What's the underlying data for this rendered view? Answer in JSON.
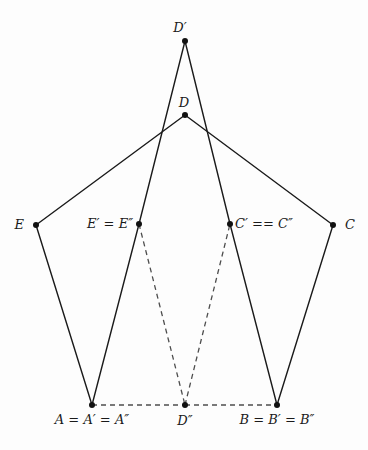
{
  "figure": {
    "width": 368,
    "height": 450,
    "background_color": "#fdfdfd",
    "stroke_color": "#1a1a1a",
    "dash_color": "#555555"
  },
  "points": {
    "D_prime": {
      "label": "D′",
      "x": 185,
      "y": 41,
      "label_x": 180,
      "label_y": 27,
      "align": "center"
    },
    "D": {
      "label": "D",
      "x": 185,
      "y": 115,
      "label_x": 184,
      "label_y": 102,
      "align": "center"
    },
    "E": {
      "label": "E",
      "x": 36,
      "y": 225,
      "label_x": 24,
      "label_y": 224,
      "align": "right"
    },
    "E_prime": {
      "label": "E′ = E″",
      "x": 139,
      "y": 224,
      "label_x": 133,
      "label_y": 223,
      "align": "right"
    },
    "C_prime": {
      "label": "C′ == C″",
      "x": 230,
      "y": 224,
      "label_x": 235,
      "label_y": 223,
      "align": "left"
    },
    "C": {
      "label": "C",
      "x": 333,
      "y": 225,
      "label_x": 345,
      "label_y": 224,
      "align": "left"
    },
    "A": {
      "label": "A = A′ = A″",
      "x": 92,
      "y": 405,
      "label_x": 92,
      "label_y": 419,
      "align": "center"
    },
    "D_dprime": {
      "label": "D″",
      "x": 185,
      "y": 405,
      "label_x": 185,
      "label_y": 420,
      "align": "center"
    },
    "B": {
      "label": "B = B′ = B″",
      "x": 277,
      "y": 405,
      "label_x": 277,
      "label_y": 419,
      "align": "center"
    }
  },
  "edges_solid": [
    {
      "name": "edge-E-D",
      "x1": 36,
      "y1": 225,
      "x2": 185,
      "y2": 115
    },
    {
      "name": "edge-D-C",
      "x1": 185,
      "y1": 115,
      "x2": 333,
      "y2": 225
    },
    {
      "name": "edge-E-A",
      "x1": 36,
      "y1": 225,
      "x2": 92,
      "y2": 405
    },
    {
      "name": "edge-C-B",
      "x1": 333,
      "y1": 225,
      "x2": 277,
      "y2": 405
    },
    {
      "name": "edge-Dprime-Eprime",
      "x1": 185,
      "y1": 41,
      "x2": 139,
      "y2": 224
    },
    {
      "name": "edge-Dprime-Cprime",
      "x1": 185,
      "y1": 41,
      "x2": 230,
      "y2": 224
    },
    {
      "name": "edge-Eprime-A",
      "x1": 139,
      "y1": 224,
      "x2": 92,
      "y2": 405
    },
    {
      "name": "edge-Cprime-B",
      "x1": 230,
      "y1": 224,
      "x2": 277,
      "y2": 405
    }
  ],
  "edges_dashed": [
    {
      "name": "edge-Eprime-Ddprime",
      "x1": 139,
      "y1": 224,
      "x2": 185,
      "y2": 405
    },
    {
      "name": "edge-Ddprime-Cprime",
      "x1": 185,
      "y1": 405,
      "x2": 230,
      "y2": 224
    },
    {
      "name": "edge-A-Ddprime",
      "x1": 92,
      "y1": 405,
      "x2": 185,
      "y2": 405
    },
    {
      "name": "edge-Ddprime-B",
      "x1": 185,
      "y1": 405,
      "x2": 277,
      "y2": 405
    }
  ]
}
